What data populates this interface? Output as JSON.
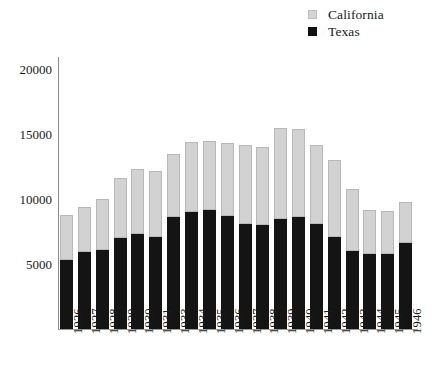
{
  "legend": {
    "position": "top-right",
    "entries": [
      {
        "label": "California",
        "color": "#d2d2d2",
        "key": "california"
      },
      {
        "label": "Texas",
        "color": "#141414",
        "key": "texas"
      }
    ]
  },
  "axis": {
    "y_ticks": [
      "20000",
      "15000",
      "10000",
      "5000"
    ],
    "y_tick_values": [
      20000,
      15000,
      10000,
      5000
    ]
  },
  "chart_data": {
    "type": "bar",
    "subtype": "stacked-vertical",
    "title": "",
    "subtitle": "",
    "xlabel": "",
    "ylabel": "",
    "ylim": [
      0,
      21500
    ],
    "grid": false,
    "legend_position": "top-right",
    "stacked": true,
    "categories": [
      "1926",
      "1927",
      "1928",
      "1929",
      "1930",
      "1931",
      "1933",
      "1934",
      "1935",
      "1936",
      "1937",
      "1938",
      "1939",
      "1940",
      "1941",
      "1942",
      "1943",
      "1944",
      "1945",
      "1946"
    ],
    "series": [
      {
        "name": "Texas",
        "color": "#141414",
        "values": [
          5300,
          5900,
          6100,
          7000,
          7300,
          7100,
          8600,
          9000,
          9200,
          8700,
          8100,
          8000,
          8500,
          8600,
          8100,
          7100,
          6000,
          5800,
          5800,
          6600
        ]
      },
      {
        "name": "California",
        "color": "#d2d2d2",
        "values": [
          3500,
          3500,
          3900,
          4600,
          5000,
          5100,
          4900,
          5400,
          5300,
          5600,
          6100,
          6000,
          7000,
          6800,
          6100,
          5900,
          4800,
          3400,
          3300,
          3200
        ]
      }
    ],
    "totals": [
      8800,
      9400,
      10000,
      11600,
      12300,
      12200,
      13500,
      14400,
      14500,
      14300,
      14200,
      14000,
      15500,
      15400,
      14200,
      13000,
      10800,
      9200,
      9100,
      9800
    ]
  }
}
